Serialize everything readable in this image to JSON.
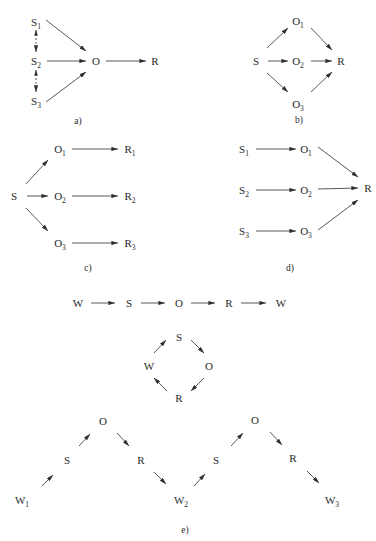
{
  "colors": {
    "ink": "#2a2a2a",
    "background": "#ffffff"
  },
  "panels": [
    {
      "id": "a",
      "caption": "a)",
      "caption_pos": [
        78,
        124
      ],
      "nodes": [
        {
          "id": "S1",
          "base": "S",
          "sub": "1",
          "x": 36,
          "y": 22
        },
        {
          "id": "S2",
          "base": "S",
          "sub": "2",
          "x": 36,
          "y": 61
        },
        {
          "id": "S3",
          "base": "S",
          "sub": "3",
          "x": 36,
          "y": 101
        },
        {
          "id": "O",
          "base": "O",
          "sub": "",
          "x": 96,
          "y": 61
        },
        {
          "id": "R",
          "base": "R",
          "sub": "",
          "x": 155,
          "y": 61
        }
      ],
      "edges": [
        {
          "x1": 46,
          "y1": 20,
          "x2": 86,
          "y2": 51,
          "style": "solid",
          "head": "end"
        },
        {
          "x1": 47,
          "y1": 61,
          "x2": 86,
          "y2": 61,
          "style": "solid",
          "head": "end"
        },
        {
          "x1": 46,
          "y1": 102,
          "x2": 86,
          "y2": 72,
          "style": "solid",
          "head": "end"
        },
        {
          "x1": 106,
          "y1": 61,
          "x2": 146,
          "y2": 61,
          "style": "solid",
          "head": "end"
        },
        {
          "x1": 36,
          "y1": 30,
          "x2": 36,
          "y2": 52,
          "style": "dashed",
          "head": "both"
        },
        {
          "x1": 36,
          "y1": 70,
          "x2": 36,
          "y2": 92,
          "style": "dashed",
          "head": "both"
        }
      ]
    },
    {
      "id": "b",
      "caption": "b)",
      "caption_pos": [
        299,
        123
      ],
      "nodes": [
        {
          "id": "O1",
          "base": "O",
          "sub": "1",
          "x": 298,
          "y": 21
        },
        {
          "id": "S",
          "base": "S",
          "sub": "",
          "x": 256,
          "y": 61
        },
        {
          "id": "O2",
          "base": "O",
          "sub": "2",
          "x": 298,
          "y": 61
        },
        {
          "id": "R",
          "base": "R",
          "sub": "",
          "x": 341,
          "y": 61
        },
        {
          "id": "O3",
          "base": "O",
          "sub": "3",
          "x": 298,
          "y": 104
        }
      ],
      "edges": [
        {
          "x1": 267,
          "y1": 48,
          "x2": 288,
          "y2": 28,
          "style": "solid",
          "head": "end"
        },
        {
          "x1": 268,
          "y1": 61,
          "x2": 288,
          "y2": 61,
          "style": "solid",
          "head": "end"
        },
        {
          "x1": 267,
          "y1": 73,
          "x2": 288,
          "y2": 92,
          "style": "solid",
          "head": "end"
        },
        {
          "x1": 311,
          "y1": 28,
          "x2": 332,
          "y2": 50,
          "style": "solid",
          "head": "end"
        },
        {
          "x1": 311,
          "y1": 61,
          "x2": 332,
          "y2": 61,
          "style": "solid",
          "head": "end"
        },
        {
          "x1": 311,
          "y1": 92,
          "x2": 332,
          "y2": 72,
          "style": "solid",
          "head": "end"
        }
      ]
    },
    {
      "id": "c",
      "caption": "c)",
      "caption_pos": [
        88,
        271
      ],
      "nodes": [
        {
          "id": "S",
          "base": "S",
          "sub": "",
          "x": 14,
          "y": 196
        },
        {
          "id": "O1",
          "base": "O",
          "sub": "1",
          "x": 60,
          "y": 149
        },
        {
          "id": "R1",
          "base": "R",
          "sub": "1",
          "x": 130,
          "y": 149
        },
        {
          "id": "O2",
          "base": "O",
          "sub": "2",
          "x": 60,
          "y": 196
        },
        {
          "id": "R2",
          "base": "R",
          "sub": "2",
          "x": 130,
          "y": 196
        },
        {
          "id": "O3",
          "base": "O",
          "sub": "3",
          "x": 60,
          "y": 243
        },
        {
          "id": "R3",
          "base": "R",
          "sub": "3",
          "x": 130,
          "y": 243
        }
      ],
      "edges": [
        {
          "x1": 26,
          "y1": 184,
          "x2": 48,
          "y2": 160,
          "style": "solid",
          "head": "end"
        },
        {
          "x1": 27,
          "y1": 196,
          "x2": 48,
          "y2": 196,
          "style": "solid",
          "head": "end"
        },
        {
          "x1": 26,
          "y1": 208,
          "x2": 48,
          "y2": 231,
          "style": "solid",
          "head": "end"
        },
        {
          "x1": 72,
          "y1": 149,
          "x2": 118,
          "y2": 149,
          "style": "solid",
          "head": "end"
        },
        {
          "x1": 72,
          "y1": 196,
          "x2": 118,
          "y2": 196,
          "style": "solid",
          "head": "end"
        },
        {
          "x1": 72,
          "y1": 243,
          "x2": 118,
          "y2": 243,
          "style": "solid",
          "head": "end"
        }
      ]
    },
    {
      "id": "d",
      "caption": "d)",
      "caption_pos": [
        290,
        271
      ],
      "nodes": [
        {
          "id": "S1",
          "base": "S",
          "sub": "1",
          "x": 244,
          "y": 149
        },
        {
          "id": "O1",
          "base": "O",
          "sub": "1",
          "x": 306,
          "y": 149
        },
        {
          "id": "S2",
          "base": "S",
          "sub": "2",
          "x": 244,
          "y": 190
        },
        {
          "id": "O2",
          "base": "O",
          "sub": "2",
          "x": 306,
          "y": 190
        },
        {
          "id": "R",
          "base": "R",
          "sub": "",
          "x": 368,
          "y": 188
        },
        {
          "id": "S3",
          "base": "S",
          "sub": "3",
          "x": 244,
          "y": 231
        },
        {
          "id": "O3",
          "base": "O",
          "sub": "3",
          "x": 306,
          "y": 231
        }
      ],
      "edges": [
        {
          "x1": 256,
          "y1": 149,
          "x2": 296,
          "y2": 149,
          "style": "solid",
          "head": "end"
        },
        {
          "x1": 256,
          "y1": 190,
          "x2": 296,
          "y2": 190,
          "style": "solid",
          "head": "end"
        },
        {
          "x1": 256,
          "y1": 231,
          "x2": 296,
          "y2": 231,
          "style": "solid",
          "head": "end"
        },
        {
          "x1": 318,
          "y1": 147,
          "x2": 358,
          "y2": 177,
          "style": "solid",
          "head": "end"
        },
        {
          "x1": 318,
          "y1": 189,
          "x2": 358,
          "y2": 188,
          "style": "solid",
          "head": "end"
        },
        {
          "x1": 318,
          "y1": 230,
          "x2": 358,
          "y2": 200,
          "style": "solid",
          "head": "end"
        }
      ]
    },
    {
      "id": "e",
      "caption": "e)",
      "caption_pos": [
        185,
        533
      ],
      "nodes": [
        {
          "id": "W_a",
          "base": "W",
          "sub": "",
          "x": 78,
          "y": 303
        },
        {
          "id": "S_a",
          "base": "S",
          "sub": "",
          "x": 129,
          "y": 303
        },
        {
          "id": "O_a",
          "base": "O",
          "sub": "",
          "x": 179,
          "y": 303
        },
        {
          "id": "R_a",
          "base": "R",
          "sub": "",
          "x": 229,
          "y": 303
        },
        {
          "id": "W_b",
          "base": "W",
          "sub": "",
          "x": 281,
          "y": 303
        },
        {
          "id": "S_c",
          "base": "S",
          "sub": "",
          "x": 179,
          "y": 337
        },
        {
          "id": "W_c",
          "base": "W",
          "sub": "",
          "x": 149,
          "y": 366
        },
        {
          "id": "O_c",
          "base": "O",
          "sub": "",
          "x": 209,
          "y": 366
        },
        {
          "id": "R_c",
          "base": "R",
          "sub": "",
          "x": 179,
          "y": 398
        },
        {
          "id": "O_1",
          "base": "O",
          "sub": "",
          "x": 103,
          "y": 421
        },
        {
          "id": "S_1",
          "base": "S",
          "sub": "",
          "x": 67,
          "y": 460
        },
        {
          "id": "R_1",
          "base": "R",
          "sub": "",
          "x": 141,
          "y": 460
        },
        {
          "id": "W1",
          "base": "W",
          "sub": "1",
          "x": 22,
          "y": 500
        },
        {
          "id": "W2",
          "base": "W",
          "sub": "2",
          "x": 181,
          "y": 500
        },
        {
          "id": "S_2",
          "base": "S",
          "sub": "",
          "x": 216,
          "y": 460
        },
        {
          "id": "O_2",
          "base": "O",
          "sub": "",
          "x": 255,
          "y": 420
        },
        {
          "id": "R_2",
          "base": "R",
          "sub": "",
          "x": 293,
          "y": 458
        },
        {
          "id": "W3",
          "base": "W",
          "sub": "3",
          "x": 332,
          "y": 500
        }
      ],
      "edges": [
        {
          "x1": 91,
          "y1": 303,
          "x2": 115,
          "y2": 303,
          "style": "solid",
          "head": "end"
        },
        {
          "x1": 141,
          "y1": 303,
          "x2": 165,
          "y2": 303,
          "style": "solid",
          "head": "end"
        },
        {
          "x1": 191,
          "y1": 303,
          "x2": 215,
          "y2": 303,
          "style": "solid",
          "head": "end"
        },
        {
          "x1": 241,
          "y1": 303,
          "x2": 266,
          "y2": 303,
          "style": "solid",
          "head": "end"
        },
        {
          "x1": 154,
          "y1": 353,
          "x2": 166,
          "y2": 340,
          "style": "solid",
          "head": "end"
        },
        {
          "x1": 191,
          "y1": 340,
          "x2": 204,
          "y2": 353,
          "style": "solid",
          "head": "end"
        },
        {
          "x1": 204,
          "y1": 378,
          "x2": 191,
          "y2": 391,
          "style": "solid",
          "head": "end"
        },
        {
          "x1": 167,
          "y1": 391,
          "x2": 154,
          "y2": 378,
          "style": "solid",
          "head": "end"
        },
        {
          "x1": 42,
          "y1": 486,
          "x2": 53,
          "y2": 475,
          "style": "solid",
          "head": "end"
        },
        {
          "x1": 79,
          "y1": 446,
          "x2": 90,
          "y2": 434,
          "style": "solid",
          "head": "end"
        },
        {
          "x1": 117,
          "y1": 433,
          "x2": 129,
          "y2": 446,
          "style": "solid",
          "head": "end"
        },
        {
          "x1": 154,
          "y1": 472,
          "x2": 166,
          "y2": 484,
          "style": "solid",
          "head": "end"
        },
        {
          "x1": 194,
          "y1": 486,
          "x2": 205,
          "y2": 474,
          "style": "solid",
          "head": "end"
        },
        {
          "x1": 231,
          "y1": 446,
          "x2": 243,
          "y2": 433,
          "style": "solid",
          "head": "end"
        },
        {
          "x1": 270,
          "y1": 432,
          "x2": 282,
          "y2": 445,
          "style": "solid",
          "head": "end"
        },
        {
          "x1": 307,
          "y1": 471,
          "x2": 319,
          "y2": 483,
          "style": "solid",
          "head": "end"
        }
      ]
    }
  ]
}
